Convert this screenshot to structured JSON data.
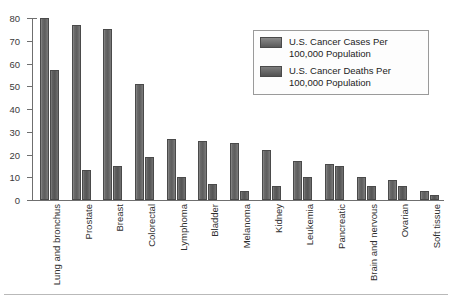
{
  "chart_data": {
    "type": "bar",
    "title": "",
    "xlabel": "",
    "ylabel": "",
    "ylim": [
      0,
      80
    ],
    "yticks": [
      0,
      10,
      20,
      30,
      40,
      50,
      60,
      70,
      80
    ],
    "grid": false,
    "legend_position": "top-right",
    "categories": [
      "Lung and bronchus",
      "Prostate",
      "Breast",
      "Colorectal",
      "Lymphoma",
      "Bladder",
      "Melanoma",
      "Kidney",
      "Leukemia",
      "Pancreatic",
      "Brain and nervous",
      "Ovarian",
      "Soft tissue"
    ],
    "series": [
      {
        "name": "U.S. Cancer Cases Per 100,000 Population",
        "values": [
          80,
          77,
          75,
          51,
          27,
          26,
          25,
          22,
          17,
          16,
          10,
          9,
          4
        ]
      },
      {
        "name": "U.S. Cancer Deaths Per 100,000 Population",
        "values": [
          57,
          13,
          15,
          19,
          10,
          7,
          4,
          6,
          10,
          15,
          6,
          6,
          2
        ]
      }
    ]
  },
  "legend": {
    "items": [
      {
        "label_line1": "U.S. Cancer Cases Per",
        "label_line2": "100,000 Population"
      },
      {
        "label_line1": "U.S. Cancer Deaths Per",
        "label_line2": "100,000 Population"
      }
    ]
  }
}
